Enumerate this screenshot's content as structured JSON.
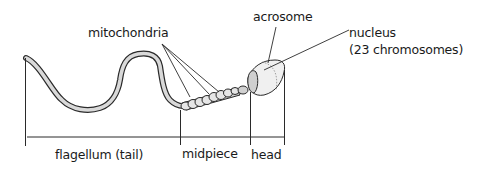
{
  "diagram": {
    "labels": {
      "mitochondria": "mitochondria",
      "acrosome": "acrosome",
      "nucleus": "nucleus",
      "nucleus_detail": "(23 chromosomes)"
    },
    "regions": {
      "flagellum": "flagellum (tail)",
      "midpiece": "midpiece",
      "head": "head"
    },
    "colors": {
      "outline": "#2a2a2a",
      "fill": "#d9d9d9",
      "head_fill": "#f0f0f0",
      "background": "#ffffff"
    }
  }
}
